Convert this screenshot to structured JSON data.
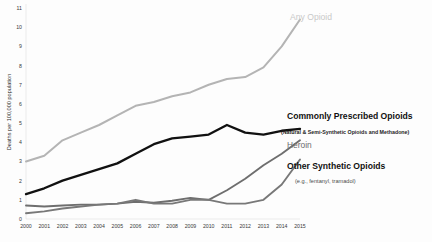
{
  "chart_data": {
    "type": "line",
    "title": "",
    "xlabel": "",
    "ylabel": "Deaths per 100,000 population",
    "x": [
      2000,
      2001,
      2002,
      2003,
      2004,
      2005,
      2006,
      2007,
      2008,
      2009,
      2010,
      2011,
      2012,
      2013,
      2014,
      2015
    ],
    "xtick_labels": [
      "2000",
      "2001",
      "2002",
      "2003",
      "2004",
      "2005",
      "2006",
      "2007",
      "2008",
      "2009",
      "2010",
      "2011",
      "2012",
      "2013",
      "2014",
      "2015"
    ],
    "ytick_labels": [
      "0",
      "1",
      "2",
      "3",
      "4",
      "5",
      "6",
      "7",
      "8",
      "9",
      "10",
      "11"
    ],
    "ylim": [
      0,
      11
    ],
    "xlim": [
      2000,
      2015
    ],
    "grid": false,
    "legend_position": "inline-right-annotations",
    "series": [
      {
        "name": "Any Opioid",
        "color": "#b4b4b4",
        "values": [
          3.0,
          3.3,
          4.1,
          4.5,
          4.9,
          5.4,
          5.9,
          6.1,
          6.4,
          6.6,
          7.0,
          7.3,
          7.4,
          7.9,
          9.0,
          10.4
        ]
      },
      {
        "name": "Commonly Prescribed Opioids",
        "color": "#111111",
        "values": [
          1.3,
          1.6,
          2.0,
          2.3,
          2.6,
          2.9,
          3.4,
          3.9,
          4.2,
          4.3,
          4.4,
          4.9,
          4.5,
          4.4,
          4.6,
          4.7
        ]
      },
      {
        "name": "Heroin",
        "color": "#6e6e6e",
        "values": [
          0.7,
          0.65,
          0.7,
          0.75,
          0.75,
          0.8,
          0.9,
          0.85,
          0.95,
          1.1,
          1.0,
          1.5,
          2.1,
          2.8,
          3.4,
          4.1
        ]
      },
      {
        "name": "Other Synthetic Opioids",
        "color": "#787878",
        "values": [
          0.3,
          0.4,
          0.55,
          0.65,
          0.75,
          0.8,
          1.0,
          0.8,
          0.8,
          1.0,
          1.0,
          0.8,
          0.8,
          1.0,
          1.8,
          3.1
        ]
      }
    ],
    "annotations": [
      {
        "id": "any-opioid",
        "text": "Any Opioid",
        "series": "Any Opioid"
      },
      {
        "id": "commonly-prescribed",
        "text": "Commonly Prescribed Opioids",
        "subtext": "(Natural & Semi-Synthetic Opioids and Methadone)",
        "series": "Commonly Prescribed Opioids"
      },
      {
        "id": "heroin",
        "text": "Heroin",
        "series": "Heroin"
      },
      {
        "id": "other-synthetic",
        "text": "Other Synthetic Opioids",
        "subtext": "(e.g., fentanyl, tramadol)",
        "series": "Other Synthetic Opioids"
      }
    ]
  }
}
